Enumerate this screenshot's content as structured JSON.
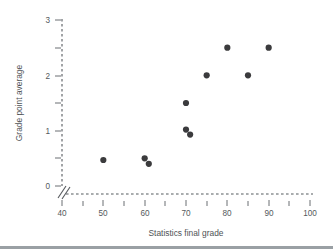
{
  "chart_data": {
    "type": "scatter",
    "title": "",
    "xlabel": "Statistics final grade",
    "ylabel": "Grade point average",
    "xlim": [
      40,
      100
    ],
    "ylim": [
      0,
      3
    ],
    "grid": false,
    "legend": null,
    "axis_break": true,
    "x_major_ticks": [
      40,
      50,
      60,
      70,
      80,
      90,
      100
    ],
    "x_minor_ticks": [
      45,
      55,
      65,
      75,
      85,
      95
    ],
    "x_ticklabels": [
      "40",
      "50",
      "60",
      "70",
      "80",
      "90",
      "100"
    ],
    "y_major_ticks": [
      0,
      1,
      2,
      3
    ],
    "y_minor_ticks": [
      0.5,
      1.5,
      2.5
    ],
    "y_ticklabels": [
      "0",
      "1",
      "2",
      "3"
    ],
    "points": [
      {
        "x": 50,
        "y": 0.47
      },
      {
        "x": 60,
        "y": 0.5
      },
      {
        "x": 61,
        "y": 0.4
      },
      {
        "x": 70,
        "y": 1.5
      },
      {
        "x": 70,
        "y": 1.02
      },
      {
        "x": 71,
        "y": 0.93
      },
      {
        "x": 75,
        "y": 2.0
      },
      {
        "x": 80,
        "y": 2.5
      },
      {
        "x": 85,
        "y": 2.0
      },
      {
        "x": 90,
        "y": 2.5
      }
    ],
    "marker": {
      "shape": "circle",
      "size": 3.1,
      "color": "#3b3b3d"
    },
    "colors": {
      "axis": "#555a5e",
      "tick": "#6a6f73",
      "text": "#55595c",
      "marker": "#3b3b3d",
      "background": "#ffffff"
    }
  }
}
